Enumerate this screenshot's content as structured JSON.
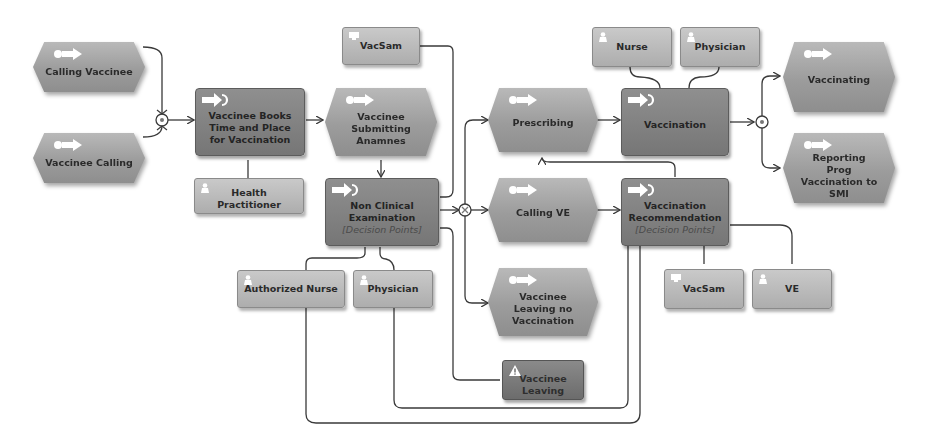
{
  "diagram": {
    "type": "EPC process model",
    "colors": {
      "event": "#9e9e9e",
      "function": "#7d7d7d",
      "role": "#b9b9b9",
      "risk": "#747474",
      "connector": "#3a3a3a"
    },
    "events": [
      {
        "id": "e1",
        "label": "Calling Vaccinee"
      },
      {
        "id": "e2",
        "label": "Vaccinee Calling"
      },
      {
        "id": "e3",
        "label": "Vaccinee Submitting Anamnes"
      },
      {
        "id": "e4",
        "label": "Prescribing"
      },
      {
        "id": "e5",
        "label": "Calling VE"
      },
      {
        "id": "e6",
        "label": "Vaccinee Leaving no Vaccination"
      },
      {
        "id": "e7",
        "label": "Vaccinating"
      },
      {
        "id": "e8",
        "label": "Reporting Prog Vaccination to SMI"
      }
    ],
    "functions": [
      {
        "id": "f1",
        "label": "Vaccinee Books Time and Place for Vaccination",
        "sub": ""
      },
      {
        "id": "f2",
        "label": "Non Clinical Examination",
        "sub": "[Decision Points]"
      },
      {
        "id": "f3",
        "label": "Vaccination",
        "sub": ""
      },
      {
        "id": "f4",
        "label": "Vaccination Recommendation",
        "sub": "[Decision Points]"
      }
    ],
    "roles": [
      {
        "id": "r1",
        "label": "Health Practitioner",
        "icon": "person-icon"
      },
      {
        "id": "r2",
        "label": "VacSam",
        "icon": "system-icon"
      },
      {
        "id": "r3",
        "label": "Authorized Nurse",
        "icon": "person-icon"
      },
      {
        "id": "r4",
        "label": "Physician",
        "icon": "person-icon"
      },
      {
        "id": "r5",
        "label": "Nurse",
        "icon": "person-icon"
      },
      {
        "id": "r6",
        "label": "Physician",
        "icon": "person-icon"
      },
      {
        "id": "r7",
        "label": "VacSam",
        "icon": "system-icon"
      },
      {
        "id": "r8",
        "label": "VE",
        "icon": "person-icon"
      }
    ],
    "risks": [
      {
        "id": "k1",
        "label": "Vaccinee Leaving",
        "icon": "warning-icon"
      }
    ],
    "gateways": [
      {
        "id": "g1",
        "type": "XOR join"
      },
      {
        "id": "g2",
        "type": "XOR split"
      },
      {
        "id": "g3",
        "type": "AND split"
      }
    ]
  }
}
